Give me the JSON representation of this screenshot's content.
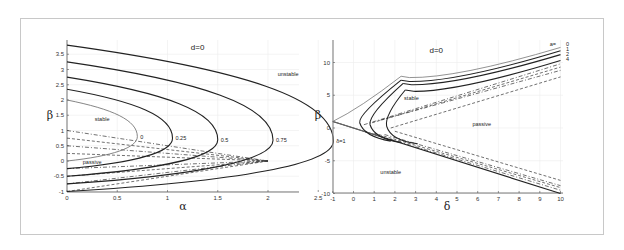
{
  "chart_data": [
    {
      "type": "line",
      "title": "d=0",
      "xlabel": "α",
      "ylabel": "β",
      "xlim": [
        0,
        2.75
      ],
      "ylim": [
        -1,
        3.9
      ],
      "xticks": [
        "0",
        "0.5",
        "1",
        "1.5",
        "2",
        "2.5"
      ],
      "yticks": [
        "-1",
        "-0.5",
        "0",
        "0.5",
        "1",
        "1.5",
        "2",
        "2.5",
        "3",
        "3.5"
      ],
      "grid": true,
      "region_labels": [
        "stable",
        "passive",
        "unstable"
      ],
      "series": [
        {
          "name": "0",
          "style": "solid-thin",
          "top": 2.0,
          "nose_alpha": 0.7,
          "nose_beta": 0.8,
          "bottom": 0.0
        },
        {
          "name": "0.25",
          "style": "solid",
          "top": 2.35,
          "nose_alpha": 1.05,
          "nose_beta": 0.75,
          "bottom": -0.25
        },
        {
          "name": "0.5",
          "style": "solid",
          "top": 2.75,
          "nose_alpha": 1.5,
          "nose_beta": 0.7,
          "bottom": -0.5
        },
        {
          "name": "0.75",
          "style": "solid",
          "top": 3.25,
          "nose_alpha": 2.05,
          "nose_beta": 0.68,
          "bottom": -0.75
        },
        {
          "name": "δ=1",
          "style": "solid",
          "top": 3.8,
          "nose_alpha": 2.65,
          "nose_beta": 0.65,
          "bottom": -1.0
        }
      ],
      "dashed_lines": [
        {
          "from": [
            0,
            1.0
          ],
          "to": [
            2.0,
            0.0
          ]
        },
        {
          "from": [
            0,
            0.75
          ],
          "to": [
            2.0,
            0.0
          ]
        },
        {
          "from": [
            0,
            0.5
          ],
          "to": [
            2.0,
            0.0
          ]
        },
        {
          "from": [
            0,
            0.25
          ],
          "to": [
            2.0,
            0.0
          ]
        },
        {
          "from": [
            0,
            -0.25
          ],
          "to": [
            2.0,
            0.0
          ]
        },
        {
          "from": [
            0,
            -0.5
          ],
          "to": [
            2.0,
            0.0
          ]
        },
        {
          "from": [
            0,
            -0.75
          ],
          "to": [
            2.0,
            0.0
          ]
        },
        {
          "from": [
            0,
            -1.0
          ],
          "to": [
            2.0,
            0.0
          ]
        }
      ],
      "annotations": [
        {
          "text": "stable",
          "x": 0.35,
          "y": 1.3
        },
        {
          "text": "passive",
          "x": 0.25,
          "y": -0.1
        },
        {
          "text": "unstable",
          "x": 2.2,
          "y": 2.8
        },
        {
          "text": "d=0",
          "x": 1.3,
          "y": 3.65
        }
      ]
    },
    {
      "type": "line",
      "title": "d=0",
      "xlabel": "δ",
      "ylabel": "β",
      "xlim": [
        -1,
        10
      ],
      "ylim": [
        -10,
        13
      ],
      "xticks": [
        "-1",
        "0",
        "1",
        "2",
        "3",
        "4",
        "5",
        "6",
        "7",
        "8",
        "9",
        "10"
      ],
      "yticks": [
        "-10",
        "-5",
        "0",
        "5",
        "10"
      ],
      "grid": true,
      "legend_title": "a=",
      "legend": [
        "0",
        "1",
        "2",
        "4"
      ],
      "series": [
        {
          "name": "0",
          "style": "solid-thin",
          "corner": [
            2.3,
            7.9
          ],
          "nose": [
            -1,
            1
          ],
          "end": [
            10,
            12.3
          ]
        },
        {
          "name": "1",
          "style": "solid",
          "corner": [
            2.3,
            7.3
          ],
          "nose": [
            0.3,
            0.8
          ],
          "end": [
            10,
            11.8
          ]
        },
        {
          "name": "2",
          "style": "solid",
          "corner": [
            2.4,
            6.8
          ],
          "nose": [
            0.8,
            0.5
          ],
          "end": [
            10,
            11.2
          ]
        },
        {
          "name": "4",
          "style": "solid",
          "corner": [
            2.5,
            5.8
          ],
          "nose": [
            1.6,
            0.3
          ],
          "end": [
            10,
            10.3
          ]
        }
      ],
      "lower_boundary": {
        "from": [
          -1,
          1
        ],
        "to": [
          10,
          -10
        ]
      },
      "dashed_upper": [
        {
          "from": [
            0.5,
            0.5
          ],
          "to": [
            10,
            9.8
          ]
        },
        {
          "from": [
            0.9,
            0.8
          ],
          "to": [
            10,
            9.3
          ]
        },
        {
          "from": [
            1.3,
            1.2
          ],
          "to": [
            10,
            8.8
          ]
        },
        {
          "from": [
            1.8,
            0.0
          ],
          "to": [
            10,
            7.8
          ]
        }
      ],
      "dashed_lower": [
        {
          "from": [
            0.5,
            -0.5
          ],
          "to": [
            10,
            -9.5
          ]
        },
        {
          "from": [
            1.0,
            -0.8
          ],
          "to": [
            10,
            -9.1
          ]
        },
        {
          "from": [
            1.5,
            -1.0
          ],
          "to": [
            10,
            -8.8
          ]
        },
        {
          "from": [
            2.0,
            -0.5
          ],
          "to": [
            10,
            -8.0
          ]
        }
      ],
      "annotations": [
        {
          "text": "stable",
          "x": 2.8,
          "y": 4.2
        },
        {
          "text": "passive",
          "x": 6.2,
          "y": 0.3
        },
        {
          "text": "unstable",
          "x": 1.8,
          "y": -7
        },
        {
          "text": "d=0",
          "x": 4.0,
          "y": 11.5
        }
      ]
    }
  ]
}
